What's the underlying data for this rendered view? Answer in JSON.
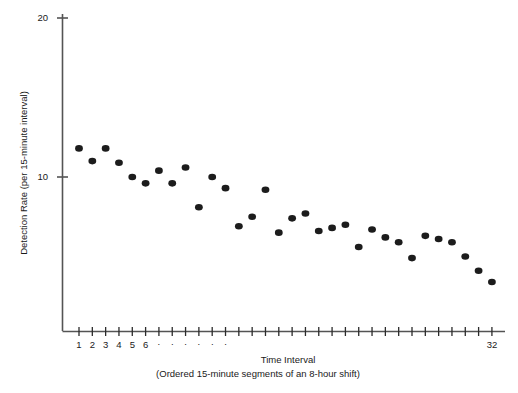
{
  "chart_data": {
    "type": "scatter",
    "title": "",
    "xlabel": "Time Interval",
    "xlabel_sub": "(Ordered 15-minute segments of an 8-hour shift)",
    "ylabel": "Detection Rate (per 15-minute interval)",
    "xlim": [
      0.3,
      32.7
    ],
    "ylim": [
      0,
      20
    ],
    "xticks_count": 32,
    "xtick_labels": [
      "1",
      "2",
      "3",
      "4",
      "5",
      "6",
      ".",
      ".",
      ".",
      ".",
      ".",
      ".",
      "32"
    ],
    "xtick_label_positions": [
      1,
      2,
      3,
      4,
      5,
      6,
      7,
      8,
      9,
      10,
      11,
      12,
      32
    ],
    "ytick_labels": [
      "10",
      "20"
    ],
    "ytick_values": [
      10,
      20
    ],
    "grid": false,
    "legend": "none",
    "marker": "filled-circle",
    "marker_color": "#1c1c1c",
    "x": [
      1,
      2,
      3,
      4,
      5,
      6,
      7,
      8,
      9,
      10,
      11,
      12,
      13,
      14,
      15,
      16,
      17,
      18,
      19,
      20,
      21,
      22,
      23,
      24,
      25,
      26,
      27,
      28,
      29,
      30,
      31,
      32
    ],
    "values": [
      11.8,
      11.0,
      11.8,
      10.9,
      10.0,
      9.6,
      10.4,
      9.6,
      10.6,
      8.1,
      10.0,
      9.3,
      6.9,
      7.5,
      9.2,
      6.5,
      7.4,
      7.7,
      6.6,
      6.8,
      7.0,
      5.6,
      6.7,
      6.2,
      5.9,
      4.9,
      6.3,
      6.1,
      5.9,
      5.0,
      4.1,
      3.4
    ]
  },
  "caption": {
    "text": ""
  }
}
